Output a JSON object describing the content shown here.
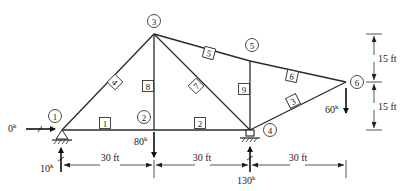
{
  "diagram": {
    "type": "truss",
    "nodes": [
      {
        "id": "1",
        "label": "1",
        "x": 62,
        "y": 130,
        "lx": 53,
        "ly": 117
      },
      {
        "id": "2",
        "label": "2",
        "x": 154,
        "y": 130,
        "lx": 144,
        "ly": 117
      },
      {
        "id": "3",
        "label": "3",
        "x": 154,
        "y": 34,
        "lx": 154,
        "ly": 20
      },
      {
        "id": "4",
        "label": "4",
        "x": 250,
        "y": 130,
        "lx": 269,
        "ly": 129
      },
      {
        "id": "5",
        "label": "5",
        "x": 250,
        "y": 61,
        "lx": 252,
        "ly": 44
      },
      {
        "id": "6",
        "label": "6",
        "x": 346,
        "y": 82,
        "lx": 358,
        "ly": 82
      }
    ],
    "members": [
      {
        "id": "1",
        "label": "1",
        "from": "1",
        "to": "2",
        "lx": 105,
        "ly": 123,
        "rot": 0
      },
      {
        "id": "2",
        "label": "2",
        "from": "2",
        "to": "4",
        "lx": 200,
        "ly": 123,
        "rot": 0
      },
      {
        "id": "3",
        "label": "3",
        "from": "4",
        "to": "6",
        "lx": 293,
        "ly": 102,
        "rot": -28
      },
      {
        "id": "4",
        "label": "4",
        "from": "1",
        "to": "3",
        "lx": 115,
        "ly": 82,
        "rot": 46
      },
      {
        "id": "5",
        "label": "5",
        "from": "3",
        "to": "5",
        "lx": 209,
        "ly": 53,
        "rot": 13
      },
      {
        "id": "6",
        "label": "6",
        "from": "5",
        "to": "6",
        "lx": 292,
        "ly": 76,
        "rot": 13
      },
      {
        "id": "7",
        "label": "7",
        "from": "3",
        "to": "4",
        "lx": 197,
        "ly": 86,
        "rot": -44
      },
      {
        "id": "8",
        "label": "8",
        "from": "2",
        "to": "3",
        "lx": 149,
        "ly": 86,
        "rot": 0
      },
      {
        "id": "9",
        "label": "9",
        "from": "4",
        "to": "5",
        "lx": 244,
        "ly": 90,
        "rot": 0
      }
    ],
    "loads": [
      {
        "id": "H1",
        "label": "0",
        "unit": "k",
        "node": "1",
        "direction": "right",
        "text": "0k"
      },
      {
        "id": "R1",
        "label": "10",
        "unit": "k",
        "node": "1",
        "direction": "up",
        "text": "10k"
      },
      {
        "id": "P2",
        "label": "80",
        "unit": "k",
        "node": "2",
        "direction": "down",
        "text": "80k"
      },
      {
        "id": "R4",
        "label": "130",
        "unit": "k",
        "node": "4",
        "direction": "up",
        "text": "130k"
      },
      {
        "id": "P6",
        "label": "60",
        "unit": "k",
        "node": "6",
        "direction": "down",
        "text": "60k"
      }
    ],
    "dimensions": {
      "horizontal": [
        {
          "label": "30 ft",
          "from_x": 62,
          "to_x": 154
        },
        {
          "label": "30 ft",
          "from_x": 154,
          "to_x": 250
        },
        {
          "label": "30 ft",
          "from_x": 250,
          "to_x": 346
        }
      ],
      "vertical": [
        {
          "label": "15 ft",
          "from_y": 34,
          "to_y": 82
        },
        {
          "label": "15 ft",
          "from_y": 82,
          "to_y": 130
        }
      ]
    },
    "supports": [
      {
        "node": "1",
        "type": "pin"
      },
      {
        "node": "4",
        "type": "roller"
      }
    ]
  },
  "labels": {
    "load_h1_value": "0",
    "load_r1_value": "10",
    "load_p2_value": "80",
    "load_r4_value": "130",
    "load_p6_value": "60",
    "unit_sup": "k",
    "dim_h1": "30 ft",
    "dim_h2": "30 ft",
    "dim_h3": "30 ft",
    "dim_v1": "15 ft",
    "dim_v2": "15 ft",
    "node_1": "1",
    "node_2": "2",
    "node_3": "3",
    "node_4": "4",
    "node_5": "5",
    "node_6": "6",
    "member_1": "1",
    "member_2": "2",
    "member_3": "3",
    "member_4": "4",
    "member_5": "5",
    "member_6": "6",
    "member_7": "7",
    "member_8": "8",
    "member_9": "9"
  }
}
